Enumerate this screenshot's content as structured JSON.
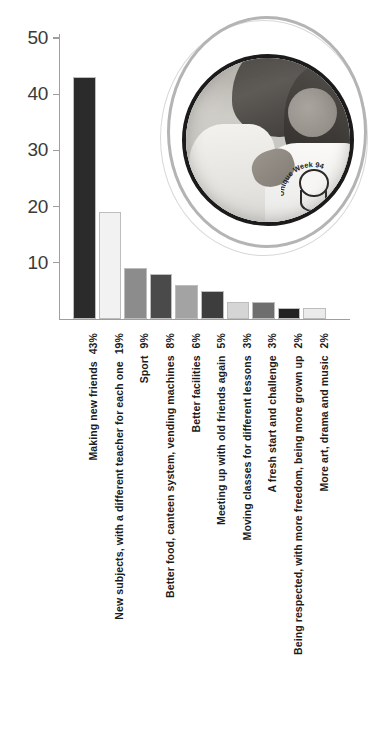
{
  "chart_data": {
    "type": "bar",
    "title": "",
    "xlabel": "",
    "ylabel": "",
    "ylim": [
      0,
      50
    ],
    "ytick_labels": [
      "0",
      "10",
      "20",
      "30",
      "40",
      "50"
    ],
    "ytick_values": [
      0,
      10,
      20,
      30,
      40,
      50
    ],
    "grid": false,
    "legend": "none",
    "categories": [
      "Making new friends",
      "New subjects, with a different teacher for each one",
      "Sport",
      "Better food, canteen system, vending machines",
      "Better facilities",
      "Meeting up with old friends again",
      "Moving classes for different lessons",
      "A fresh start and challenge",
      "Being respected, with more freedom, being more grown up",
      "More art, drama and music"
    ],
    "values": [
      43,
      19,
      9,
      8,
      6,
      5,
      3,
      3,
      2,
      2
    ],
    "value_labels": [
      "43%",
      "19%",
      "9%",
      "8%",
      "6%",
      "5%",
      "3%",
      "3%",
      "2%",
      "2%"
    ],
    "bar_colors": [
      "#2b2b2b",
      "#f2f2f2",
      "#8c8c8c",
      "#4a4a4a",
      "#a3a3a3",
      "#3d3d3d",
      "#d5d5d5",
      "#6e6e6e",
      "#222222",
      "#ebebeb"
    ]
  },
  "photo": {
    "alt_name": "two-students-photo",
    "shirt_text_top": "Unique Week",
    "shirt_text_year": "94"
  },
  "axis": {
    "color": "#9e9e9e"
  }
}
